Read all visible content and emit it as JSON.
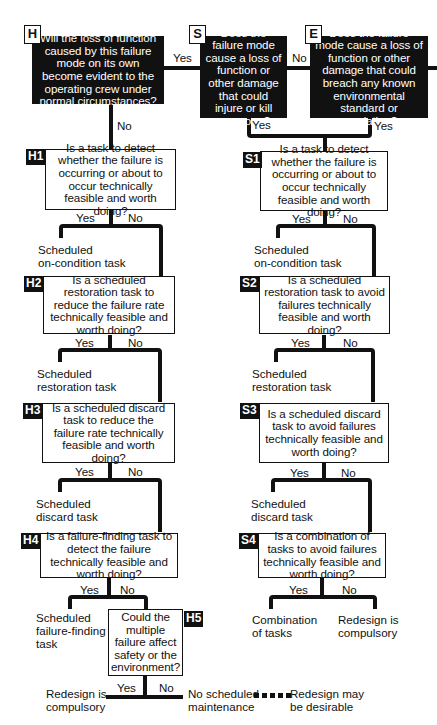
{
  "diagram": {
    "type": "RCM decision flowchart",
    "nodes": {
      "H": {
        "tag": "H",
        "question": "Will the loss of function caused by this failure mode on its own become evident to the operating crew under normal circumstances?"
      },
      "S": {
        "tag": "S",
        "question": "Does the failure mode cause a loss of function or other damage that could injure or kill someone?"
      },
      "E": {
        "tag": "E",
        "question": "Does the failure mode cause a loss of function or other damage that could breach any known environmental standard or regulation?"
      },
      "H1": {
        "tag": "H1",
        "question": "Is a task to detect whether the failure is occurring or about to occur technically feasible and worth doing?"
      },
      "H2": {
        "tag": "H2",
        "question": "Is a scheduled restoration task to reduce the failure rate technically feasible and worth doing?"
      },
      "H3": {
        "tag": "H3",
        "question": "Is a scheduled discard task to reduce the failure rate technically feasible and worth doing?"
      },
      "H4": {
        "tag": "H4",
        "question": "Is a failure-finding task to detect the failure technically feasible and worth doing?"
      },
      "H5": {
        "tag": "H5",
        "question": "Could the multiple failure affect safety or the environment?"
      },
      "S1": {
        "tag": "S1",
        "question": "Is a task to detect whether the failure is occurring or about to occur technically feasible and worth doing?"
      },
      "S2": {
        "tag": "S2",
        "question": "Is a scheduled restoration task to avoid failures technically feasible and worth doing?"
      },
      "S3": {
        "tag": "S3",
        "question": "Is a scheduled discard task to avoid failures technically feasible and worth doing?"
      },
      "S4": {
        "tag": "S4",
        "question": "Is a combination of tasks to avoid failures technically feasible and worth doing?"
      }
    },
    "edge_labels": {
      "yes": "Yes",
      "no": "No"
    },
    "outcomes": {
      "h1_yes": "Scheduled\non-condition task",
      "h2_yes": "Scheduled\nrestoration task",
      "h3_yes": "Scheduled\ndiscard task",
      "h4_yes": "Scheduled\nfailure-finding\ntask",
      "h5_yes": "Redesign is\ncompulsory",
      "h5_no": "No scheduled\nmaintenance",
      "h5_no_optional": "Redesign may\nbe desirable",
      "s1_yes": "Scheduled\non-condition task",
      "s2_yes": "Scheduled\nrestoration task",
      "s3_yes": "Scheduled\ndiscard task",
      "s4_yes": "Combination\nof tasks",
      "s4_no": "Redesign is\ncompulsory"
    },
    "colors": {
      "ink": "#111111",
      "background": "#ffffff"
    }
  }
}
